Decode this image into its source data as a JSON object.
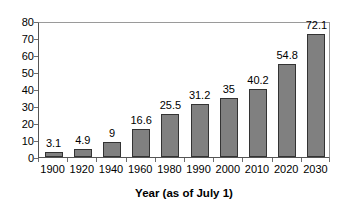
{
  "chart_data": {
    "type": "bar",
    "title": "",
    "xlabel": "Year (as of July 1)",
    "ylabel": "",
    "categories": [
      "1900",
      "1920",
      "1940",
      "1960",
      "1980",
      "1990",
      "2000",
      "2010",
      "2020",
      "2030"
    ],
    "values": [
      3.1,
      4.9,
      9,
      16.6,
      25.5,
      31.2,
      35,
      40.2,
      54.8,
      72.1
    ],
    "value_labels": [
      "3.1",
      "4.9",
      "9",
      "16.6",
      "25.5",
      "31.2",
      "35",
      "40.2",
      "54.8",
      "72.1"
    ],
    "ylim": [
      0,
      80
    ],
    "ytick_labels": [
      "0",
      "10",
      "20",
      "30",
      "40",
      "50",
      "60",
      "70",
      "80"
    ],
    "ytick_values": [
      0,
      10,
      20,
      30,
      40,
      50,
      60,
      70,
      80
    ],
    "grid": false,
    "legend": false,
    "bar_color": "#808080",
    "bar_border_color": "#333333",
    "axis_color": "#555555",
    "text_color": "#000000",
    "background": "#ffffff"
  }
}
